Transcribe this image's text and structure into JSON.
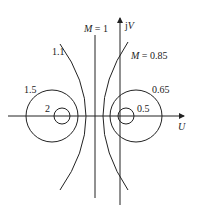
{
  "diagram": {
    "axes": {
      "x_label": "U",
      "y_label": "jV"
    },
    "curves": [
      {
        "label": "M = 1",
        "type": "vertical-line"
      },
      {
        "label": "M = 0.85",
        "type": "arc-right"
      },
      {
        "label": "1.1",
        "type": "arc-left"
      },
      {
        "label": "1.5",
        "type": "circle-left-outer"
      },
      {
        "label": "2",
        "type": "circle-left-inner"
      },
      {
        "label": "0.65",
        "type": "circle-right-outer"
      },
      {
        "label": "0.5",
        "type": "circle-right-inner"
      }
    ],
    "labels": {
      "m1_prefix": "M",
      "m1_value": " = 1",
      "m085_prefix": "M",
      "m085_value": " = 0.85",
      "v11": "1.1",
      "v15": "1.5",
      "v2": "2",
      "v065": "0.65",
      "v05": "0.5",
      "jv_j": "j",
      "jv_v": "V",
      "u": "U"
    },
    "stroke_color": "#222222"
  }
}
